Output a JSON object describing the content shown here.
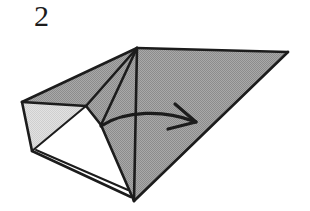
{
  "diagram": {
    "step_number": "2",
    "background_color": "#ffffff",
    "ink_color": "#1c1c1c",
    "shaded_face_color": "#9b9b9b",
    "light_face_color": "#d9d9d9",
    "white_face_color": "#ffffff",
    "stroke_width": "2.6",
    "canvas": {
      "width": 310,
      "height": 211
    },
    "vertices": {
      "top_apex": [
        137,
        48
      ],
      "right_tip": [
        288,
        52
      ],
      "bottom_apex": [
        134,
        201
      ],
      "left_apex": [
        22,
        102
      ],
      "left_lower": [
        32,
        151
      ],
      "center_hub": [
        101,
        125
      ],
      "upper_mid": [
        86,
        106
      ],
      "bottom_flap_tip": [
        131,
        196
      ],
      "bottom_flap_inner": [
        126,
        190
      ]
    },
    "faces": [
      {
        "name": "right-large-shaded-triangle",
        "fill": "#9b9b9b",
        "points": "137,48 288,52 134,201"
      },
      {
        "name": "upper-left-shaded-wing",
        "fill": "#9b9b9b",
        "points": "137,48 22,102 86,106 101,125"
      },
      {
        "name": "left-light-sliver",
        "fill": "#d9d9d9",
        "points": "22,102 32,151 86,106"
      },
      {
        "name": "lower-white-underside",
        "fill": "#ffffff",
        "points": "86,106 101,125 134,201 32,151"
      },
      {
        "name": "lower-left-shaded-gusset",
        "fill": "#9b9b9b",
        "points": "101,125 134,201 137,48"
      }
    ],
    "edges": [
      {
        "name": "top-ridge-left",
        "d": "M137,48 L22,102"
      },
      {
        "name": "top-ridge-right",
        "d": "M137,48 L288,52"
      },
      {
        "name": "right-slant",
        "d": "M288,52 L134,201"
      },
      {
        "name": "center-vertical-crease",
        "d": "M137,48 L134,201"
      },
      {
        "name": "crease-apex-to-hub",
        "d": "M137,48 L101,125"
      },
      {
        "name": "crease-apex-to-upper-mid",
        "d": "M137,48 L86,106"
      },
      {
        "name": "left-edge-upper",
        "d": "M22,102 L86,106"
      },
      {
        "name": "left-edge-lower",
        "d": "M22,102 L32,151"
      },
      {
        "name": "light-sliver-diagonal",
        "d": "M32,151 L86,106"
      },
      {
        "name": "hub-to-upper-mid",
        "d": "M101,125 L86,106"
      },
      {
        "name": "hub-to-bottom",
        "d": "M101,125 L134,201"
      },
      {
        "name": "bottom-flap-outer",
        "d": "M32,151 L131,197"
      },
      {
        "name": "bottom-flap-inner",
        "d": "M36,150 L128,190"
      }
    ],
    "arrow": {
      "name": "fold-direction-arrow",
      "label": "fold to the right",
      "curve": "M101,126 C125,110 165,110 193,121",
      "head_upper": "M175,104 L196,122",
      "head_lower": "M168,129 L196,122"
    }
  }
}
